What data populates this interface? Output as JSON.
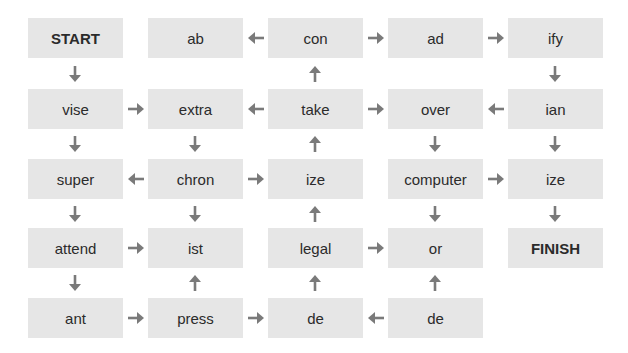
{
  "diagram": {
    "type": "word-maze",
    "colors": {
      "box": "#e6e6e6",
      "arrow": "#7a7a7a",
      "text": "#2b2b2b"
    },
    "grid": [
      [
        "START",
        "ab",
        "con",
        "ad",
        "ify"
      ],
      [
        "vise",
        "extra",
        "take",
        "over",
        "ian"
      ],
      [
        "super",
        "chron",
        "ize",
        "computer",
        "ize"
      ],
      [
        "attend",
        "ist",
        "legal",
        "or",
        "FINISH"
      ],
      [
        "ant",
        "press",
        "de",
        "de",
        ""
      ]
    ],
    "nodes": {
      "r0c0": "START",
      "r0c1": "ab",
      "r0c2": "con",
      "r0c3": "ad",
      "r0c4": "ify",
      "r1c0": "vise",
      "r1c1": "extra",
      "r1c2": "take",
      "r1c3": "over",
      "r1c4": "ian",
      "r2c0": "super",
      "r2c1": "chron",
      "r2c2": "ize",
      "r2c3": "computer",
      "r2c4": "ize",
      "r3c0": "attend",
      "r3c1": "ist",
      "r3c2": "legal",
      "r3c3": "or",
      "r3c4": "FINISH",
      "r4c0": "ant",
      "r4c1": "press",
      "r4c2": "de",
      "r4c3": "de"
    },
    "arrows": [
      {
        "from": "con",
        "to": "ab",
        "dir": "left"
      },
      {
        "from": "con",
        "to": "ad",
        "dir": "right"
      },
      {
        "from": "ad",
        "to": "ify",
        "dir": "right"
      },
      {
        "from": "START",
        "to": "vise",
        "dir": "down"
      },
      {
        "from": "take",
        "to": "con",
        "dir": "up"
      },
      {
        "from": "ify",
        "to": "ian",
        "dir": "down"
      },
      {
        "from": "vise",
        "to": "extra",
        "dir": "right"
      },
      {
        "from": "take",
        "to": "extra",
        "dir": "left"
      },
      {
        "from": "take",
        "to": "over",
        "dir": "right"
      },
      {
        "from": "ian",
        "to": "over",
        "dir": "left"
      },
      {
        "from": "vise",
        "to": "super",
        "dir": "down"
      },
      {
        "from": "extra",
        "to": "chron",
        "dir": "down"
      },
      {
        "from": "ize",
        "to": "take",
        "dir": "up"
      },
      {
        "from": "over",
        "to": "computer",
        "dir": "down"
      },
      {
        "from": "ian",
        "to": "ize",
        "dir": "down"
      },
      {
        "from": "chron",
        "to": "super",
        "dir": "left"
      },
      {
        "from": "chron",
        "to": "ize",
        "dir": "right"
      },
      {
        "from": "computer",
        "to": "ize",
        "dir": "right"
      },
      {
        "from": "super",
        "to": "attend",
        "dir": "down"
      },
      {
        "from": "chron",
        "to": "ist",
        "dir": "down"
      },
      {
        "from": "legal",
        "to": "ize",
        "dir": "up"
      },
      {
        "from": "computer",
        "to": "or",
        "dir": "down"
      },
      {
        "from": "ize",
        "to": "FINISH",
        "dir": "down"
      },
      {
        "from": "attend",
        "to": "ist",
        "dir": "right"
      },
      {
        "from": "legal",
        "to": "or",
        "dir": "right"
      },
      {
        "from": "attend",
        "to": "ant",
        "dir": "down"
      },
      {
        "from": "press",
        "to": "ist",
        "dir": "up"
      },
      {
        "from": "de",
        "to": "legal",
        "dir": "up"
      },
      {
        "from": "de",
        "to": "or",
        "dir": "up"
      },
      {
        "from": "ant",
        "to": "press",
        "dir": "right"
      },
      {
        "from": "press",
        "to": "de",
        "dir": "right"
      },
      {
        "from": "de",
        "to": "de",
        "dir": "left"
      }
    ]
  }
}
